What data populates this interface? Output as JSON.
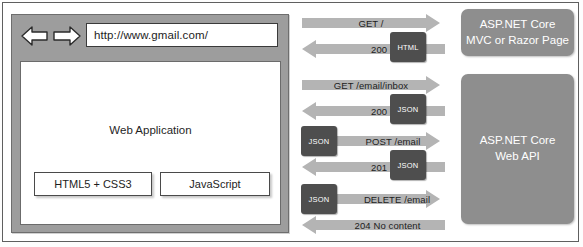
{
  "browser": {
    "nav_back_icon": "arrow-left-icon",
    "nav_forward_icon": "arrow-right-icon",
    "url": "http://www.gmail.com/",
    "url_placeholder": "Enter address",
    "viewport_label": "Web Application",
    "tech_buttons": [
      {
        "label": "HTML5 + CSS3"
      },
      {
        "label": "JavaScript"
      }
    ]
  },
  "servers": [
    {
      "id": "mvc",
      "line1": "ASP.NET Core",
      "line2": "MVC or Razor Page"
    },
    {
      "id": "webapi",
      "line1": "ASP.NET Core",
      "line2": "Web API"
    }
  ],
  "exchanges": [
    {
      "id": "get-root",
      "request_label": "GET /",
      "response_label": "200 OK",
      "request_payload": null,
      "response_payload": "HTML"
    },
    {
      "id": "get-inbox",
      "request_label": "GET /email/inbox",
      "response_label": "200 OK",
      "request_payload": null,
      "response_payload": "JSON"
    },
    {
      "id": "post-email",
      "request_label": "POST /email",
      "response_label": "201 OK",
      "request_payload": "JSON",
      "response_payload": "JSON"
    },
    {
      "id": "delete-email",
      "request_label": "DELETE /email",
      "response_label": "204 No content",
      "request_payload": "JSON",
      "response_payload": null
    }
  ],
  "colors": {
    "arrow": "#b4b4b4",
    "payload": "#4e4e4e",
    "server": "#8e8e8e",
    "browser_chrome": "#9d9d9d"
  }
}
